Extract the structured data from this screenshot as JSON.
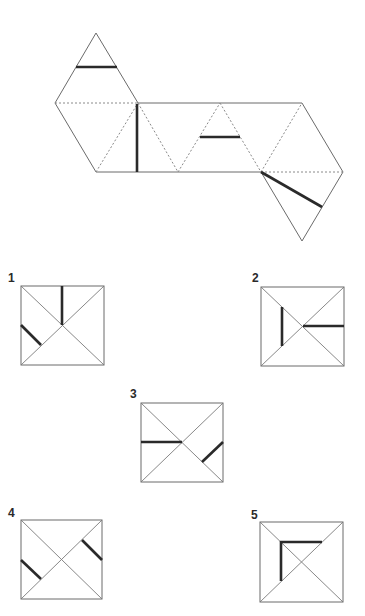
{
  "net": {
    "description": "Unfolded octahedron net with marked lines",
    "outline_color": "#6b6b6b",
    "mark_color": "#2a2a2a"
  },
  "options": [
    {
      "label": "1"
    },
    {
      "label": "2"
    },
    {
      "label": "3"
    },
    {
      "label": "4"
    },
    {
      "label": "5"
    }
  ]
}
